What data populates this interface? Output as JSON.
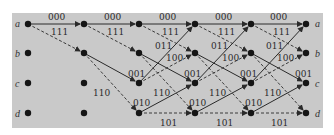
{
  "diagram": {
    "type": "trellis",
    "states": [
      "a",
      "b",
      "c",
      "d"
    ],
    "columns": 6,
    "legend": {
      "solid": "input 0",
      "dashed": "input 1"
    },
    "transitions": [
      {
        "from": "a",
        "to": "a",
        "output": "000",
        "style": "solid"
      },
      {
        "from": "a",
        "to": "b",
        "output": "111",
        "style": "dashed"
      },
      {
        "from": "b",
        "to": "c",
        "output": "001",
        "style": "solid"
      },
      {
        "from": "b",
        "to": "d",
        "output": "110",
        "style": "dashed"
      },
      {
        "from": "c",
        "to": "a",
        "output": "011",
        "style": "solid"
      },
      {
        "from": "c",
        "to": "b",
        "output": "100",
        "style": "dashed"
      },
      {
        "from": "d",
        "to": "c",
        "output": "010",
        "style": "solid"
      },
      {
        "from": "d",
        "to": "d",
        "output": "101",
        "style": "dashed"
      }
    ],
    "labels": {
      "aa": "000",
      "ab": "111",
      "bc": "001",
      "bd": "110",
      "ca": "011",
      "cb": "100",
      "dc": "010",
      "dd": "101"
    },
    "colors": {
      "background": "#c9c9c9",
      "node": "#151515",
      "line": "#2a2a2a"
    }
  }
}
